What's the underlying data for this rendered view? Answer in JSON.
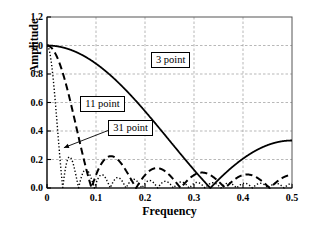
{
  "chart_data": {
    "type": "line",
    "title": "",
    "xlabel": "Frequency",
    "ylabel": "Amplitude",
    "xlim": [
      0,
      0.5
    ],
    "ylim": [
      0,
      1.2
    ],
    "xticks": [
      "0",
      "0.1",
      "0.2",
      "0.3",
      "0.4",
      "0.5"
    ],
    "xtick_values": [
      0,
      0.1,
      0.2,
      0.3,
      0.4,
      0.5
    ],
    "yticks": [
      "0.0",
      "0.2",
      "0.4",
      "0.6",
      "0.8",
      "1.0",
      "1.2"
    ],
    "ytick_values": [
      0,
      0.2,
      0.4,
      0.6,
      0.8,
      1.0,
      1.2
    ],
    "grid": true,
    "grid_style": "dashed",
    "grid_color": "#9a9a9a",
    "legend_position": "inline-annotations",
    "formula": "abs(sin(pi*f*M)/(M*sin(pi*f)))",
    "series": [
      {
        "name": "3 point",
        "taps": 3,
        "style": "solid",
        "color": "#000000",
        "linewidth": 1.8,
        "x": [
          0,
          0.025,
          0.05,
          0.075,
          0.1,
          0.125,
          0.15,
          0.175,
          0.2,
          0.225,
          0.25,
          0.275,
          0.3,
          0.325,
          0.3333,
          0.35,
          0.375,
          0.4,
          0.425,
          0.45,
          0.475,
          0.5
        ],
        "values": [
          1.0,
          0.994,
          0.976,
          0.946,
          0.905,
          0.854,
          0.793,
          0.724,
          0.648,
          0.565,
          0.471,
          0.376,
          0.275,
          0.171,
          0.0,
          0.113,
          0.214,
          0.27,
          0.303,
          0.322,
          0.331,
          0.3333
        ]
      },
      {
        "name": "11 point",
        "taps": 11,
        "style": "dashed",
        "color": "#000000",
        "linewidth": 2.0,
        "x": [
          0,
          0.02,
          0.04,
          0.06,
          0.0909,
          0.115,
          0.135,
          0.16,
          0.1818,
          0.2,
          0.225,
          0.2727,
          0.3,
          0.3636,
          0.41,
          0.4545,
          0.5
        ],
        "values": [
          1.0,
          0.928,
          0.735,
          0.48,
          0.0,
          0.17,
          0.21,
          0.15,
          0.0,
          0.09,
          0.13,
          0.0,
          0.085,
          0.0,
          0.1,
          0.0,
          0.091
        ],
        "zeros": [
          0.0909,
          0.1818,
          0.2727,
          0.3636,
          0.4545
        ],
        "sidelobe_peaks": [
          0.21,
          0.13,
          0.1,
          0.09
        ]
      },
      {
        "name": "31 point",
        "taps": 31,
        "style": "dotted",
        "color": "#000000",
        "linewidth": 1.4,
        "x": [
          0,
          0.008,
          0.016,
          0.0323,
          0.048,
          0.0645,
          0.081,
          0.0968,
          0.113,
          0.129,
          0.145,
          0.161,
          0.177,
          0.194,
          0.21,
          0.226,
          0.242,
          0.29,
          0.339,
          0.387,
          0.435,
          0.5
        ],
        "values": [
          1.0,
          0.897,
          0.64,
          0.0,
          0.21,
          0.0,
          0.13,
          0.0,
          0.09,
          0.0,
          0.075,
          0.0,
          0.065,
          0.0,
          0.06,
          0.0,
          0.055,
          0.05,
          0.045,
          0.042,
          0.04,
          0.032
        ],
        "zeros": [
          0.0323,
          0.0645,
          0.0968,
          0.129,
          0.161,
          0.194,
          0.226,
          0.258,
          0.29,
          0.323,
          0.355,
          0.387,
          0.419,
          0.452,
          0.484
        ]
      }
    ],
    "annotations": [
      {
        "label": "3 point",
        "boxed": true,
        "x": 0.212,
        "y": 0.905,
        "arrow": false
      },
      {
        "label": "11 point",
        "boxed": true,
        "x": 0.068,
        "y": 0.595,
        "arrow": false
      },
      {
        "label": "31 point",
        "boxed": true,
        "x": 0.125,
        "y": 0.425,
        "arrow": true,
        "arrow_to_x": 0.0345,
        "arrow_to_y": 0.283
      }
    ]
  },
  "axes": {
    "frame_color": "#555555",
    "axis_color": "#000000"
  }
}
